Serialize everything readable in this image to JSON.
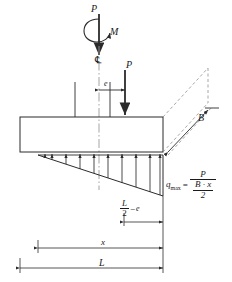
{
  "diagram": {
    "type": "engineering-free-body-diagram",
    "stroke_color": "#2b2b2b",
    "background": "#ffffff"
  },
  "labels": {
    "load_top": "P",
    "moment": "M",
    "centerline": "℄",
    "load_eccentric": "P",
    "eccentricity": "e",
    "width_B": "B",
    "dim_x": "x",
    "dim_L": "L",
    "half_L_numerator": "L",
    "half_L_denominator": "2",
    "minus_sign": "−",
    "eccentricity_in_dim": "e"
  },
  "formula": {
    "symbol": "q",
    "subscript": "max",
    "equals": "=",
    "numerator": "P",
    "denominator_numerator": "B · x",
    "denominator_denominator": "2"
  },
  "geometry": {
    "footing": {
      "left": 20,
      "top": 117,
      "right": 163,
      "bottom": 152
    },
    "pressure_triangle": {
      "apex_x": 38,
      "base_right_x": 163,
      "base_y": 155,
      "tip_y": 196
    },
    "pressure_arrow_count": 10,
    "centerline_x": 99,
    "eccentric_load_x": 125
  },
  "dimensions": {
    "x_line": {
      "start": 38,
      "end": 163,
      "y": 248
    },
    "L_line": {
      "start": 20,
      "end": 163,
      "y": 268
    },
    "half_minus_e_line": {
      "start": 124,
      "end": 163,
      "y": 222
    }
  }
}
